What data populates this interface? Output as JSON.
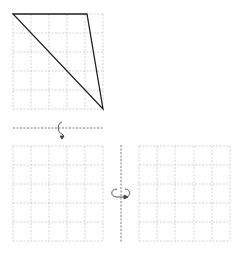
{
  "diagram": {
    "colors": {
      "grid": "#c8c8c8",
      "shape": "#222222",
      "axis": "#555555"
    },
    "top_grid": {
      "x": 13,
      "y": 14,
      "cols": 5,
      "rows": 5,
      "cell_w": 18,
      "cell_h": 19
    },
    "triangle": {
      "points": [
        [
          13,
          14
        ],
        [
          87,
          14
        ],
        [
          103,
          109
        ]
      ]
    },
    "horizontal_axis": {
      "y": 128,
      "x1": 13,
      "x2": 103
    },
    "bottom_left_grid": {
      "x": 13,
      "y": 146,
      "cols": 5,
      "rows": 5,
      "cell_w": 18,
      "cell_h": 19
    },
    "bottom_right_grid": {
      "x": 139,
      "y": 146,
      "cols": 5,
      "rows": 5,
      "cell_w": 18,
      "cell_h": 19
    },
    "vertical_axis": {
      "x": 121,
      "y1": 145,
      "y2": 243
    },
    "rotation_icons": [
      "rotate-around-horizontal-axis-icon",
      "rotate-around-vertical-axis-icon"
    ]
  }
}
